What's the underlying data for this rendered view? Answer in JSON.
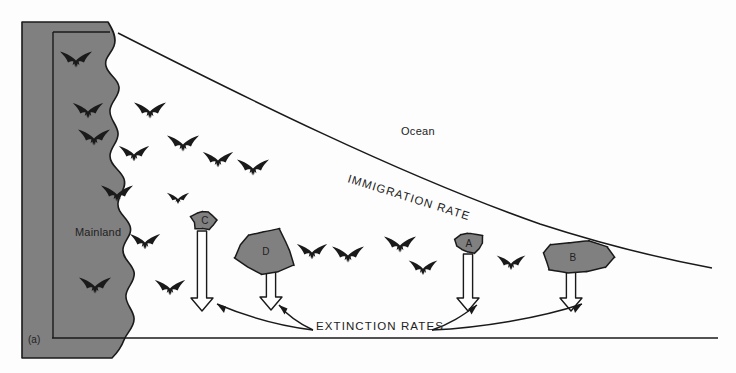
{
  "figure": {
    "panel_label": "(a)",
    "type": "island-biogeography-diagram",
    "background_color": "#fdfdfd",
    "landmass_fill": "#808080",
    "landmass_stroke": "#1a1a1a",
    "bird_color": "#1a1a1a",
    "line_color": "#1a1a1a"
  },
  "labels": {
    "mainland": "Mainland",
    "ocean": "Ocean",
    "immigration_rate": "IMMIGRATION RATE",
    "extinction_rates": "EXTINCTION RATES"
  },
  "islands": [
    {
      "id": "C",
      "label": "C",
      "size": "small",
      "cx": 204,
      "cy": 220,
      "rx": 13,
      "ry": 11,
      "arrow_top": 231,
      "arrow_bottom": 311,
      "arrow_x": 202
    },
    {
      "id": "D",
      "label": "D",
      "size": "large",
      "cx": 266,
      "cy": 251,
      "rx": 31,
      "ry": 24,
      "arrow_top": 272,
      "arrow_bottom": 310,
      "arrow_x": 271
    },
    {
      "id": "A",
      "label": "A",
      "size": "small",
      "cx": 469,
      "cy": 243,
      "rx": 14,
      "ry": 12,
      "arrow_top": 254,
      "arrow_bottom": 311,
      "arrow_x": 468
    },
    {
      "id": "B",
      "label": "B",
      "size": "medium",
      "cx": 573,
      "cy": 257,
      "rx": 36,
      "ry": 17,
      "arrow_top": 272,
      "arrow_bottom": 311,
      "arrow_x": 571
    }
  ],
  "birds": [
    {
      "x": 76,
      "y": 62,
      "s": 1.0
    },
    {
      "x": 88,
      "y": 113,
      "s": 0.95
    },
    {
      "x": 94,
      "y": 140,
      "s": 1.0
    },
    {
      "x": 134,
      "y": 156,
      "s": 0.95
    },
    {
      "x": 117,
      "y": 196,
      "s": 1.0
    },
    {
      "x": 145,
      "y": 244,
      "s": 0.95
    },
    {
      "x": 95,
      "y": 288,
      "s": 1.0
    },
    {
      "x": 150,
      "y": 113,
      "s": 1.0
    },
    {
      "x": 183,
      "y": 146,
      "s": 1.0
    },
    {
      "x": 218,
      "y": 162,
      "s": 0.95
    },
    {
      "x": 170,
      "y": 290,
      "s": 0.95
    },
    {
      "x": 178,
      "y": 200,
      "s": 0.7
    },
    {
      "x": 253,
      "y": 170,
      "s": 1.0
    },
    {
      "x": 312,
      "y": 254,
      "s": 0.95
    },
    {
      "x": 348,
      "y": 257,
      "s": 1.0
    },
    {
      "x": 400,
      "y": 247,
      "s": 1.0
    },
    {
      "x": 423,
      "y": 270,
      "s": 0.9
    },
    {
      "x": 511,
      "y": 265,
      "s": 0.9
    }
  ],
  "chart_data": {
    "type": "diagram",
    "curves": [
      {
        "name": "IMMIGRATION RATE",
        "trend": "decreasing with distance from mainland",
        "start": [
          118,
          33
        ],
        "end": [
          712,
          268
        ]
      },
      {
        "name": "BASELINE",
        "start": [
          52,
          338
        ],
        "end": [
          718,
          338
        ]
      }
    ],
    "extinction_arrow_lengths": {
      "C": 80,
      "D": 38,
      "A": 57,
      "B": 39
    },
    "notes": [
      "Small islands (A, C) show long extinction arrows = high extinction rate",
      "Larger islands (B, D) show short extinction arrows = low extinction rate",
      "Islands nearer the mainland (C, D) receive more immigrants"
    ]
  }
}
